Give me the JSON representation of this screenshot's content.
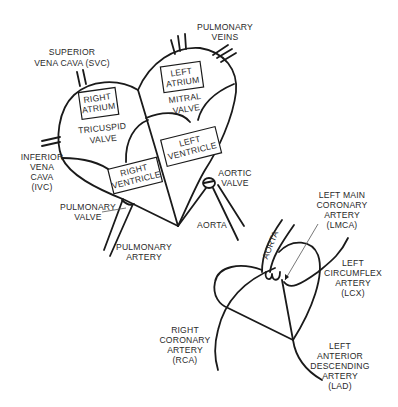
{
  "diagram": {
    "type": "heart-anatomy",
    "line_color": "#1a1a1a",
    "background": "#ffffff",
    "heart_chambers": {
      "superior_vena_cava": [
        "SUPERIOR",
        "VENA CAVA (SVC)"
      ],
      "pulmonary_veins": [
        "PULMONARY",
        "VEINS"
      ],
      "right_atrium": [
        "RIGHT",
        "ATRIUM"
      ],
      "left_atrium": [
        "LEFT",
        "ATRIUM"
      ],
      "tricuspid_valve": [
        "TRICUSPID",
        "VALVE"
      ],
      "mitral_valve": [
        "MITRAL",
        "VALVE"
      ],
      "right_ventricle": [
        "RIGHT",
        "VENTRICLE"
      ],
      "left_ventricle": [
        "LEFT",
        "VENTRICLE"
      ],
      "inferior_vena_cava": [
        "INFERIOR",
        "VENA",
        "CAVA",
        "(IVC)"
      ],
      "aortic_valve": [
        "AORTIC",
        "VALVE"
      ],
      "pulmonary_valve": [
        "PULMONARY",
        "VALVE"
      ],
      "aorta": "AORTA",
      "pulmonary_artery": [
        "PULMONARY",
        "ARTERY"
      ]
    },
    "coronary": {
      "aorta": "AORTA",
      "lmca": [
        "LEFT MAIN",
        "CORONARY",
        "ARTERY",
        "(LMCA)"
      ],
      "lcx": [
        "LEFT",
        "CIRCUMFLEX",
        "ARTERY",
        "(LCX)"
      ],
      "rca": [
        "RIGHT",
        "CORONARY",
        "ARTERY",
        "(RCA)"
      ],
      "lad": [
        "LEFT",
        "ANTERIOR",
        "DESCENDING",
        "ARTERY",
        "(LAD)"
      ]
    }
  }
}
